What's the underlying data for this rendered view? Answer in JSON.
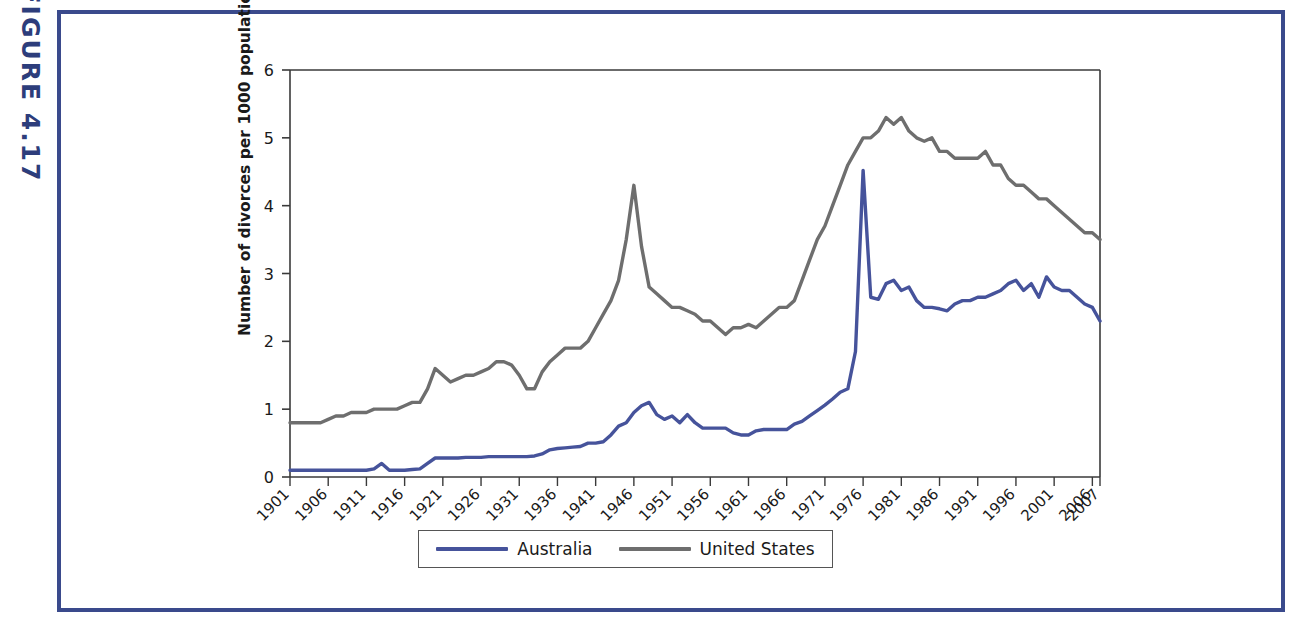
{
  "figure": {
    "label": "FIGURE 4.17",
    "label_color": "#2d3d7b",
    "frame_color": "#3a4a8c"
  },
  "legend": {
    "position": "bottom-center",
    "entries": [
      {
        "label": "Australia",
        "color": "#46539b"
      },
      {
        "label": "United States",
        "color": "#6e6e6e"
      }
    ]
  },
  "axis": {
    "y_title": "Number of divorces per 1000 population",
    "y_ticks": [
      "0",
      "1",
      "2",
      "3",
      "4",
      "5",
      "6"
    ],
    "x_ticks": [
      "1901",
      "1906",
      "1911",
      "1916",
      "1921",
      "1926",
      "1931",
      "1936",
      "1941",
      "1946",
      "1951",
      "1956",
      "1961",
      "1966",
      "1971",
      "1976",
      "1981",
      "1986",
      "1991",
      "1996",
      "2001",
      "2006",
      "2007"
    ]
  },
  "chart_data": {
    "type": "line",
    "title": "",
    "xlabel": "",
    "ylabel": "Number of divorces per 1000 population",
    "xlim": [
      1901,
      2007
    ],
    "ylim": [
      0,
      6
    ],
    "grid": false,
    "legend_position": "bottom-center",
    "x": [
      1901,
      1902,
      1903,
      1904,
      1905,
      1906,
      1907,
      1908,
      1909,
      1910,
      1911,
      1912,
      1913,
      1914,
      1915,
      1916,
      1917,
      1918,
      1919,
      1920,
      1921,
      1922,
      1923,
      1924,
      1925,
      1926,
      1927,
      1928,
      1929,
      1930,
      1931,
      1932,
      1933,
      1934,
      1935,
      1936,
      1937,
      1938,
      1939,
      1940,
      1941,
      1942,
      1943,
      1944,
      1945,
      1946,
      1947,
      1948,
      1949,
      1950,
      1951,
      1952,
      1953,
      1954,
      1955,
      1956,
      1957,
      1958,
      1959,
      1960,
      1961,
      1962,
      1963,
      1964,
      1965,
      1966,
      1967,
      1968,
      1969,
      1970,
      1971,
      1972,
      1973,
      1974,
      1975,
      1976,
      1977,
      1978,
      1979,
      1980,
      1981,
      1982,
      1983,
      1984,
      1985,
      1986,
      1987,
      1988,
      1989,
      1990,
      1991,
      1992,
      1993,
      1994,
      1995,
      1996,
      1997,
      1998,
      1999,
      2000,
      2001,
      2002,
      2003,
      2004,
      2005,
      2006,
      2007
    ],
    "series": [
      {
        "name": "Australia",
        "color": "#46539b",
        "values": [
          0.1,
          0.1,
          0.1,
          0.1,
          0.1,
          0.1,
          0.1,
          0.1,
          0.1,
          0.1,
          0.1,
          0.12,
          0.2,
          0.1,
          0.1,
          0.1,
          0.11,
          0.12,
          0.2,
          0.28,
          0.28,
          0.28,
          0.28,
          0.29,
          0.29,
          0.29,
          0.3,
          0.3,
          0.3,
          0.3,
          0.3,
          0.3,
          0.31,
          0.34,
          0.4,
          0.42,
          0.43,
          0.44,
          0.45,
          0.5,
          0.5,
          0.52,
          0.62,
          0.75,
          0.8,
          0.95,
          1.05,
          1.1,
          0.92,
          0.85,
          0.9,
          0.8,
          0.92,
          0.8,
          0.72,
          0.72,
          0.72,
          0.72,
          0.65,
          0.62,
          0.62,
          0.68,
          0.7,
          0.7,
          0.7,
          0.7,
          0.78,
          0.82,
          0.9,
          0.98,
          1.06,
          1.15,
          1.25,
          1.3,
          1.85,
          4.52,
          2.65,
          2.62,
          2.85,
          2.9,
          2.75,
          2.8,
          2.6,
          2.5,
          2.5,
          2.48,
          2.45,
          2.55,
          2.6,
          2.6,
          2.65,
          2.65,
          2.7,
          2.75,
          2.85,
          2.9,
          2.75,
          2.85,
          2.65,
          2.95,
          2.8,
          2.75,
          2.75,
          2.65,
          2.55,
          2.5,
          2.3
        ]
      },
      {
        "name": "United States",
        "color": "#6e6e6e",
        "values": [
          0.8,
          0.8,
          0.8,
          0.8,
          0.8,
          0.85,
          0.9,
          0.9,
          0.95,
          0.95,
          0.95,
          1.0,
          1.0,
          1.0,
          1.0,
          1.05,
          1.1,
          1.1,
          1.3,
          1.6,
          1.5,
          1.4,
          1.45,
          1.5,
          1.5,
          1.55,
          1.6,
          1.7,
          1.7,
          1.65,
          1.5,
          1.3,
          1.3,
          1.55,
          1.7,
          1.8,
          1.9,
          1.9,
          1.9,
          2.0,
          2.2,
          2.4,
          2.6,
          2.9,
          3.5,
          4.3,
          3.4,
          2.8,
          2.7,
          2.6,
          2.5,
          2.5,
          2.45,
          2.4,
          2.3,
          2.3,
          2.2,
          2.1,
          2.2,
          2.2,
          2.25,
          2.2,
          2.3,
          2.4,
          2.5,
          2.5,
          2.6,
          2.9,
          3.2,
          3.5,
          3.7,
          4.0,
          4.3,
          4.6,
          4.8,
          5.0,
          5.0,
          5.1,
          5.3,
          5.2,
          5.3,
          5.1,
          5.0,
          4.95,
          5.0,
          4.8,
          4.8,
          4.7,
          4.7,
          4.7,
          4.7,
          4.8,
          4.6,
          4.6,
          4.4,
          4.3,
          4.3,
          4.2,
          4.1,
          4.1,
          4.0,
          3.9,
          3.8,
          3.7,
          3.6,
          3.6,
          3.5
        ]
      }
    ]
  }
}
